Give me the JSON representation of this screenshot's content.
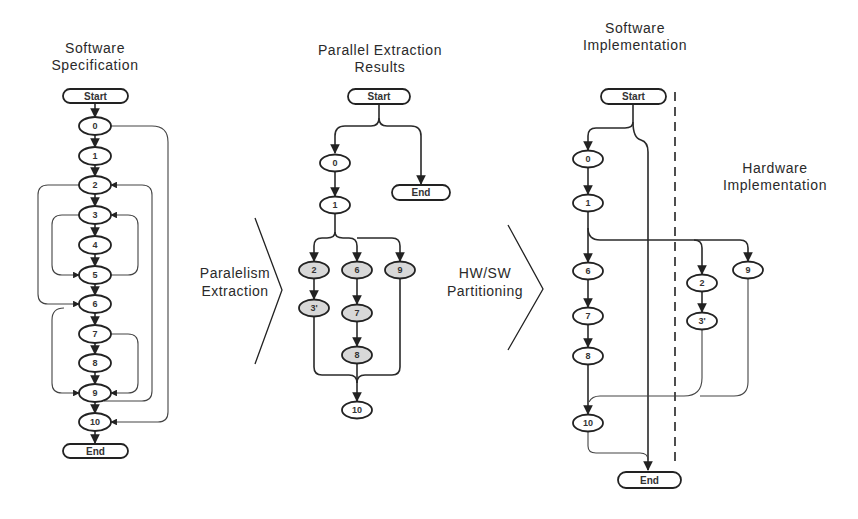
{
  "titles": {
    "software_specification": "Software\nSpecification",
    "parallel_extraction_results": "Parallel Extraction\nResults",
    "software_implementation": "Software\nImplementation",
    "hardware_implementation": "Hardware\nImplementation"
  },
  "steps": {
    "parallelism_extraction": "Paralelism\nExtraction",
    "hw_sw_partitioning": "HW/SW\nPartitioning"
  },
  "terminals": {
    "start": "Start",
    "end": "End"
  },
  "colors": {
    "node_fill": "#ffffff",
    "shaded_node_fill": "#d8d8d8",
    "stroke": "#222222",
    "background": "#ffffff"
  },
  "software_specification": {
    "nodes": [
      "0",
      "1",
      "2",
      "3",
      "4",
      "5",
      "6",
      "7",
      "8",
      "9",
      "10"
    ],
    "edges": [
      [
        "Start",
        "0"
      ],
      [
        "0",
        "1"
      ],
      [
        "1",
        "2"
      ],
      [
        "2",
        "3"
      ],
      [
        "3",
        "4"
      ],
      [
        "4",
        "5"
      ],
      [
        "5",
        "6"
      ],
      [
        "6",
        "7"
      ],
      [
        "7",
        "8"
      ],
      [
        "8",
        "9"
      ],
      [
        "9",
        "10"
      ],
      [
        "10",
        "End"
      ],
      [
        "2",
        "6"
      ],
      [
        "3",
        "5"
      ],
      [
        "5",
        "3"
      ],
      [
        "6",
        "9"
      ],
      [
        "7",
        "9"
      ],
      [
        "9",
        "2"
      ],
      [
        "0",
        "10"
      ]
    ]
  },
  "parallel_extraction": {
    "nodes": {
      "n0": "0",
      "n1": "1",
      "n2": "2",
      "n3p": "3'",
      "n6": "6",
      "n7": "7",
      "n8": "8",
      "n9": "9",
      "n10": "10"
    },
    "shaded": [
      "2",
      "3'",
      "6",
      "7",
      "8",
      "9"
    ]
  },
  "implementation": {
    "software_nodes": {
      "n0": "0",
      "n1": "1",
      "n6": "6",
      "n7": "7",
      "n8": "8",
      "n10": "10"
    },
    "hardware_nodes": {
      "n2": "2",
      "n3p": "3'",
      "n9": "9"
    }
  }
}
